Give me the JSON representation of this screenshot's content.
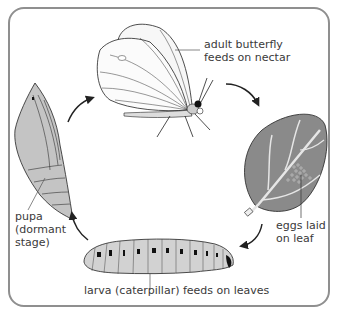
{
  "diagram": {
    "stages": [
      {
        "id": "adult",
        "label_lines": [
          "adult butterfly",
          "feeds on nectar"
        ]
      },
      {
        "id": "eggs",
        "label_lines": [
          "eggs laid",
          "on leaf"
        ]
      },
      {
        "id": "larva",
        "label_lines": [
          "larva (caterpillar) feeds on leaves"
        ]
      },
      {
        "id": "pupa",
        "label_lines": [
          "pupa",
          "(dormant",
          "stage)"
        ]
      }
    ],
    "cycle_order": [
      "adult",
      "eggs",
      "larva",
      "pupa",
      "adult"
    ],
    "colors": {
      "frame_border": "#8f8f8f",
      "leaf_fill": "#8a8a8a",
      "leaf_vein": "#e6e6e6",
      "larva_fill": "#d2d2d2",
      "pupa_fill": "#c4c4c4",
      "wing_fill": "#f7f7f7",
      "line": "#222222",
      "text": "#3a3a3a"
    }
  }
}
